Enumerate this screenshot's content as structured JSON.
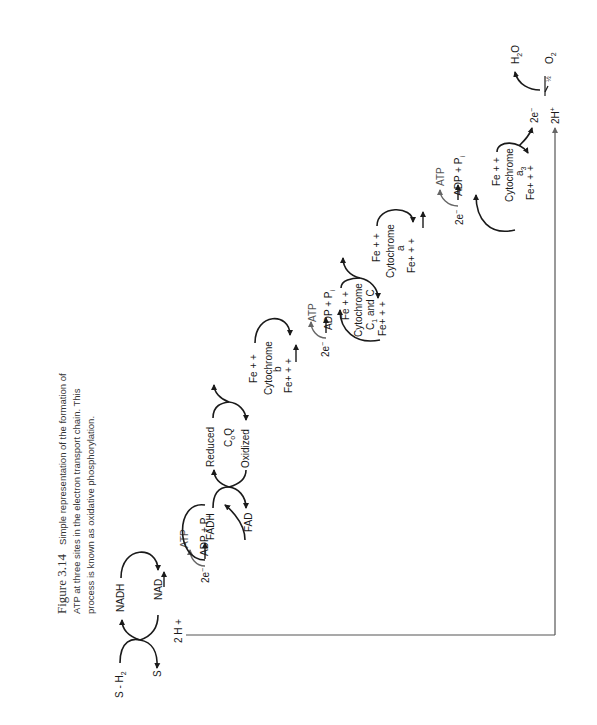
{
  "caption": {
    "figure_label": "Figure 3.14",
    "lines": [
      "Simple representation of the formation of",
      "ATP at three sites in the electron transport chain. This",
      "process is known as oxidative phosphorylation."
    ]
  },
  "diagram": {
    "substrate": {
      "reduced": "S - H",
      "reduced_sub": "2",
      "oxidized": "S"
    },
    "nad": {
      "reduced": "NADH",
      "oxidized": "NAD"
    },
    "protons_1": "2 H +",
    "site_1": {
      "electrons": "2e",
      "electrons_sup": "−",
      "atp": "ATP",
      "adp": "ADP  +  P",
      "adp_sub": "i"
    },
    "fad": {
      "reduced": "FADH",
      "oxidized": "FAD"
    },
    "coq": {
      "reduced": "Reduced",
      "name": "C",
      "name_sub": "o",
      "name_tail": "Q",
      "oxidized": "Oxidized"
    },
    "cyt_b": {
      "top": "Fe + +",
      "name": "Cytochrome",
      "letter": "b",
      "bottom": "Fe+ + +"
    },
    "site_2": {
      "electrons": "2e",
      "electrons_sup": "−",
      "atp": "ATP",
      "adp": "ADP  +  P",
      "adp_sub": "i"
    },
    "cyt_c": {
      "top": "Fe + +",
      "name": "Cytochrome",
      "letter": "C",
      "letter_sub": "1",
      "letter_tail": " and C",
      "bottom": "Fe+ + +"
    },
    "cyt_a": {
      "top": "Fe + +",
      "name": "Cytochrome",
      "letter": "a",
      "bottom": "Fe+ + +"
    },
    "site_3": {
      "electrons": "2e",
      "electrons_sup": "−",
      "atp": "ATP",
      "adp": "ADP  +  P",
      "adp_sub": "i"
    },
    "cyt_a3": {
      "top": "Fe + +",
      "name": "Cytochrome",
      "letter": "a",
      "letter_sub": "3",
      "bottom": "Fe+ + +"
    },
    "final": {
      "electrons": "2e",
      "electrons_sup": "−",
      "water": "H",
      "water_sub": "2",
      "water_tail": "O",
      "half": "½",
      "oxygen": "O",
      "oxygen_sub": "2",
      "protons": "2H",
      "protons_sup": "+"
    }
  }
}
